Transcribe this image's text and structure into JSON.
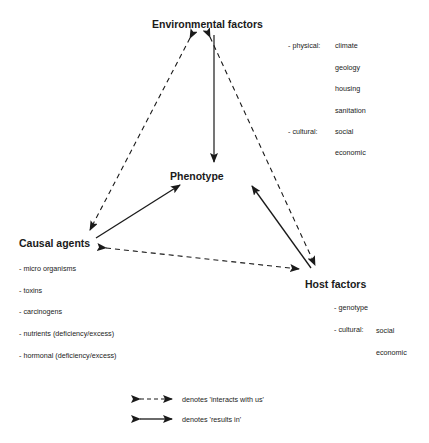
{
  "nodes": {
    "environmental": "Environmental factors",
    "phenotype": "Phenotype",
    "causal": "Causal agents",
    "host": "Host factors"
  },
  "environmental_factors": {
    "physical_label": "- physical:",
    "physical": [
      "climate",
      "geology",
      "housing",
      "sanitation"
    ],
    "cultural_label": "- cultural:",
    "cultural": [
      "social",
      "economic"
    ]
  },
  "causal_agents": [
    "- micro organisms",
    "- toxins",
    "- carcinogens",
    "- nutrients (deficiency/excess)",
    "- hormonal (deficiency/excess)"
  ],
  "host_factors": {
    "genotype": "- genotype",
    "cultural_label": "- cultural:",
    "cultural": [
      "social",
      "economic"
    ]
  },
  "legend": {
    "dashed": "denotes 'interacts with us'",
    "solid": "denotes 'results in'"
  },
  "colors": {
    "ink": "#1a1a1a",
    "background": "#ffffff"
  }
}
